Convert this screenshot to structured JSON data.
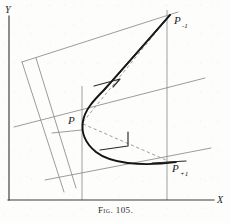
{
  "figure": {
    "caption": "Fig. 105.",
    "axes": {
      "x_label": "X",
      "y_label": "Y",
      "x_axis_name": "horizontal-axis",
      "y_axis_name": "vertical-axis"
    },
    "points": [
      {
        "id": "p-minus-1",
        "label": "P",
        "sub": "-1",
        "x": 167,
        "y": 18
      },
      {
        "id": "p-center",
        "label": "P",
        "sub": "",
        "x": 82,
        "y": 122
      },
      {
        "id": "p-plus-1",
        "label": "P",
        "sub": "+1",
        "x": 167,
        "y": 161
      }
    ],
    "elements": [
      {
        "name": "parabolic-curve",
        "type": "curve"
      },
      {
        "name": "chord-p-to-p-minus-1",
        "type": "dashed"
      },
      {
        "name": "chord-p-to-p-plus-1",
        "type": "dashed"
      },
      {
        "name": "tangent-segment-upper",
        "type": "solid"
      },
      {
        "name": "tangent-segment-lower",
        "type": "solid"
      },
      {
        "name": "oblique-grid",
        "type": "parallelogram"
      }
    ],
    "colors": {
      "curve": "#141414",
      "grid": "#8a8a8a",
      "dashed": "#9c9c9c",
      "axis": "#3b3b3b",
      "paper": "#fdfdfc"
    }
  }
}
